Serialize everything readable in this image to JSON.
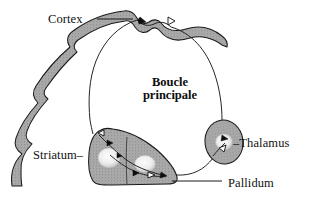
{
  "figure": {
    "title_main": "Boucle principale",
    "title_line1": "Boucle",
    "title_line2": "principale",
    "language": "fr",
    "background_color": "#ffffff",
    "ink_color": "#000000",
    "structure_fill": "#a6a6a6",
    "structure_fill_light": "#bdbdbd",
    "nucleus_fill": "#f2f2f2",
    "outline_color": "#1a1a1a"
  },
  "labels": {
    "cortex": "Cortex",
    "striatum": "Striatum–",
    "thalamus": "–Thalamus",
    "pallidum": "Pallidum"
  },
  "structures": [
    {
      "name": "cortex",
      "label": "Cortex",
      "shape": "scalloped-band",
      "fill": "#a6a6a6"
    },
    {
      "name": "striatum",
      "label": "Striatum",
      "shape": "wedge",
      "fill": "#9e9e9e"
    },
    {
      "name": "pallidum",
      "label": "Pallidum",
      "shape": "wedge-lateral",
      "fill": "#a8a8a8"
    },
    {
      "name": "thalamus",
      "label": "Thalamus",
      "shape": "ellipse",
      "fill": "#a6a6a6"
    }
  ],
  "connections": [
    {
      "from": "cortex",
      "to": "striatum",
      "marker": "filled-arrowhead"
    },
    {
      "from": "striatum",
      "to": "pallidum",
      "marker": "open-arrowhead"
    },
    {
      "from": "pallidum",
      "to": "thalamus",
      "marker": "filled-arrowhead"
    },
    {
      "from": "thalamus",
      "to": "cortex",
      "marker": "open-arrowhead"
    }
  ],
  "markers": {
    "filled_arrowhead": "filled-arrowhead",
    "open_arrowhead": "open-arrowhead"
  }
}
